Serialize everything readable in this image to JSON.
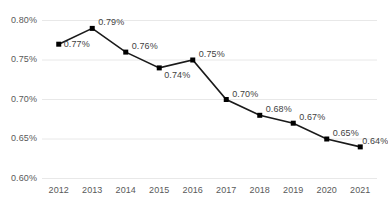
{
  "chart_data": {
    "type": "line",
    "title": "",
    "subtitle": "",
    "xlabel": "",
    "ylabel": "",
    "categories": [
      "2012",
      "2013",
      "2014",
      "2015",
      "2016",
      "2017",
      "2018",
      "2019",
      "2020",
      "2021"
    ],
    "values": [
      0.77,
      0.79,
      0.76,
      0.74,
      0.75,
      0.7,
      0.68,
      0.67,
      0.65,
      0.64
    ],
    "data_labels": [
      "0.77%",
      "0.79%",
      "0.76%",
      "0.74%",
      "0.75%",
      "0.70%",
      "0.68%",
      "0.67%",
      "0.65%",
      "0.64%"
    ],
    "ylim": [
      0.6,
      0.8
    ],
    "ytick_values": [
      0.8,
      0.75,
      0.7,
      0.65,
      0.6
    ],
    "ytick_labels": [
      "0.80%",
      "0.75%",
      "0.70%",
      "0.65%",
      "0.60%"
    ],
    "grid": true,
    "grid_axis": "y",
    "legend": false,
    "legend_position": "none",
    "series_name": "",
    "marker": "square",
    "line_color": "#1a1a1a",
    "marker_color": "#000000",
    "grid_color": "#e8e8e8",
    "label_color": "#3f3f3f",
    "tick_color": "#595959",
    "background_color": "#ffffff"
  },
  "axes": {
    "y_ticks": [
      {
        "label": "0.80%",
        "value": 0.8
      },
      {
        "label": "0.75%",
        "value": 0.75
      },
      {
        "label": "0.70%",
        "value": 0.7
      },
      {
        "label": "0.65%",
        "value": 0.65
      },
      {
        "label": "0.60%",
        "value": 0.6
      }
    ],
    "x_ticks": [
      {
        "label": "2012"
      },
      {
        "label": "2013"
      },
      {
        "label": "2014"
      },
      {
        "label": "2015"
      },
      {
        "label": "2016"
      },
      {
        "label": "2017"
      },
      {
        "label": "2018"
      },
      {
        "label": "2019"
      },
      {
        "label": "2020"
      },
      {
        "label": "2021"
      }
    ]
  },
  "points": [
    {
      "label": "0.77%",
      "category": "2012",
      "value": 0.77
    },
    {
      "label": "0.79%",
      "category": "2013",
      "value": 0.79
    },
    {
      "label": "0.76%",
      "category": "2014",
      "value": 0.76
    },
    {
      "label": "0.74%",
      "category": "2015",
      "value": 0.74
    },
    {
      "label": "0.75%",
      "category": "2016",
      "value": 0.75
    },
    {
      "label": "0.70%",
      "category": "2017",
      "value": 0.7
    },
    {
      "label": "0.68%",
      "category": "2018",
      "value": 0.68
    },
    {
      "label": "0.67%",
      "category": "2019",
      "value": 0.67
    },
    {
      "label": "0.65%",
      "category": "2020",
      "value": 0.65
    },
    {
      "label": "0.64%",
      "category": "2021",
      "value": 0.64
    }
  ]
}
